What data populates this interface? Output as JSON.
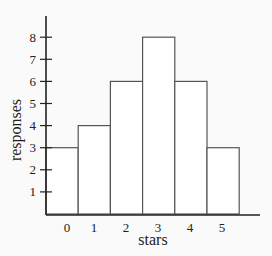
{
  "chart_data": {
    "type": "bar",
    "title": "",
    "xlabel": "stars",
    "ylabel": "responses",
    "categories": [
      "0",
      "1",
      "2",
      "3",
      "4",
      "5"
    ],
    "values": [
      3,
      4,
      6,
      8,
      6,
      3
    ],
    "ylim": [
      0,
      9
    ],
    "yticks": [
      1,
      2,
      3,
      4,
      5,
      6,
      7,
      8
    ],
    "grid": false,
    "legend": null,
    "bar_style": {
      "fill": "#ffffff",
      "stroke": "#555555"
    }
  }
}
